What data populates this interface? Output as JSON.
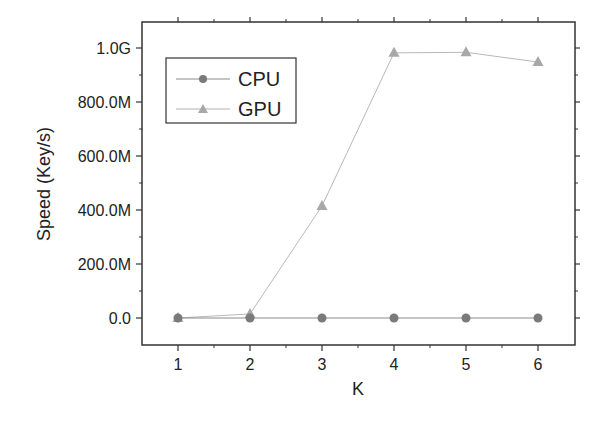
{
  "chart_data": {
    "type": "line",
    "title": "",
    "xlabel": "K",
    "ylabel": "Speed (Key/s)",
    "x": [
      1,
      2,
      3,
      4,
      5,
      6
    ],
    "xticks": [
      "1",
      "2",
      "3",
      "4",
      "5",
      "6"
    ],
    "yticks": [
      "0.0",
      "200.0M",
      "400.0M",
      "600.0M",
      "800.0M",
      "1.0G"
    ],
    "ylim": [
      -100000000,
      1100000000
    ],
    "xlim": [
      0.5,
      6.5
    ],
    "grid": false,
    "legend_position": "upper-left",
    "series": [
      {
        "name": "CPU",
        "marker": "circle",
        "color": "#7a7a7a",
        "values": [
          0,
          0,
          0,
          0,
          0,
          0
        ]
      },
      {
        "name": "GPU",
        "marker": "triangle",
        "color": "#a8a8a8",
        "values": [
          0,
          15000000,
          415000000,
          982000000,
          984000000,
          948000000
        ]
      }
    ]
  },
  "legend": {
    "items": [
      {
        "label": "CPU"
      },
      {
        "label": "GPU"
      }
    ]
  }
}
